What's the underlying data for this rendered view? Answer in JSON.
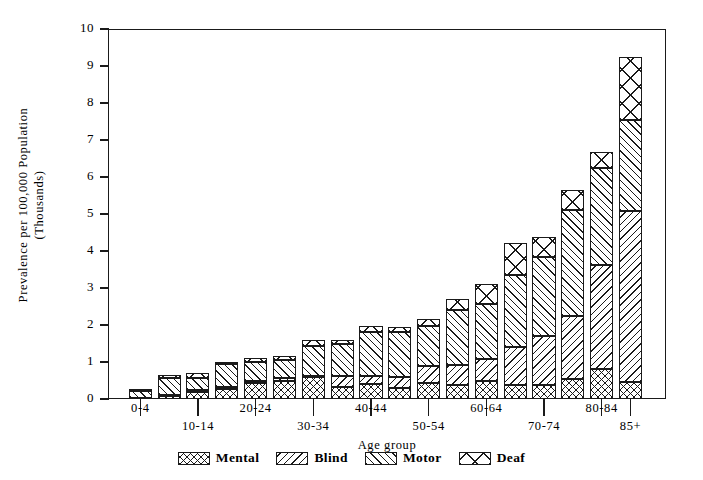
{
  "chart_data": {
    "type": "bar",
    "subtype": "stacked-vertical",
    "title": "",
    "xlabel": "Age group",
    "ylabel": "Prevalence per 100,000 Population (Thousands)",
    "ylabel_lines": [
      "Prevalence per 100,000 Population",
      "(Thousands)"
    ],
    "ylim": [
      0,
      10
    ],
    "yticks": [
      0,
      1,
      2,
      3,
      4,
      5,
      6,
      7,
      8,
      9,
      10
    ],
    "ytick_labels": [
      "0",
      "1",
      "2",
      "3",
      "4",
      "5",
      "6",
      "7",
      "8",
      "9",
      "10"
    ],
    "grid": false,
    "legend_position": "bottom",
    "categories": [
      "0-4",
      "5-9",
      "10-14",
      "15-19",
      "20-24",
      "25-29",
      "30-34",
      "35-39",
      "40-44",
      "45-49",
      "50-54",
      "55-59",
      "60-64",
      "65-69",
      "70-74",
      "75-79",
      "80-84",
      "85+"
    ],
    "xtick_labels": [
      {
        "label": "0-4",
        "category_index": 0,
        "row": 0
      },
      {
        "label": "10-14",
        "category_index": 2,
        "row": 1
      },
      {
        "label": "20-24",
        "category_index": 4,
        "row": 0
      },
      {
        "label": "30-34",
        "category_index": 6,
        "row": 1
      },
      {
        "label": "40-44",
        "category_index": 8,
        "row": 0
      },
      {
        "label": "50-54",
        "category_index": 10,
        "row": 1
      },
      {
        "label": "60-64",
        "category_index": 12,
        "row": 0
      },
      {
        "label": "70-74",
        "category_index": 14,
        "row": 1
      },
      {
        "label": "80-84",
        "category_index": 16,
        "row": 0
      },
      {
        "label": "85+",
        "category_index": 17,
        "row": 1
      }
    ],
    "series": [
      {
        "name": "Mental",
        "pattern": "crosshatch-fine",
        "values": [
          0.02,
          0.08,
          0.2,
          0.28,
          0.42,
          0.5,
          0.6,
          0.32,
          0.4,
          0.31,
          0.44,
          0.37,
          0.5,
          0.37,
          0.38,
          0.53,
          0.81,
          0.47
        ]
      },
      {
        "name": "Blind",
        "pattern": "backslash",
        "values": [
          0.02,
          0.03,
          0.04,
          0.05,
          0.07,
          0.08,
          0.03,
          0.29,
          0.22,
          0.29,
          0.46,
          0.54,
          0.58,
          1.04,
          1.33,
          1.71,
          2.81,
          4.62
        ]
      },
      {
        "name": "Motor",
        "pattern": "forwardslash",
        "values": [
          0.19,
          0.46,
          0.33,
          0.61,
          0.52,
          0.48,
          0.8,
          0.88,
          1.2,
          1.22,
          1.08,
          1.5,
          1.49,
          1.93,
          2.13,
          2.88,
          2.63,
          2.46
        ]
      },
      {
        "name": "Deaf",
        "pattern": "x-coarse",
        "values": [
          0.02,
          0.08,
          0.13,
          0.06,
          0.09,
          0.09,
          0.17,
          0.11,
          0.15,
          0.13,
          0.19,
          0.29,
          0.54,
          0.88,
          0.55,
          0.53,
          0.42,
          1.7
        ]
      }
    ],
    "totals": [
      0.25,
      0.65,
      0.7,
      1.0,
      1.1,
      1.15,
      1.6,
      1.6,
      1.97,
      1.95,
      2.17,
      2.7,
      3.11,
      4.22,
      4.39,
      5.65,
      6.67,
      9.25
    ]
  },
  "legend": {
    "items": [
      {
        "label": "Mental",
        "pattern": "crosshatch-fine"
      },
      {
        "label": "Blind",
        "pattern": "backslash"
      },
      {
        "label": "Motor",
        "pattern": "forwardslash"
      },
      {
        "label": "Deaf",
        "pattern": "x-coarse"
      }
    ]
  }
}
